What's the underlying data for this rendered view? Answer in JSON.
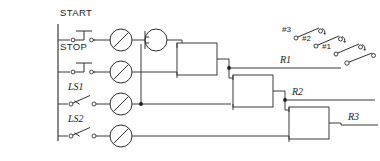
{
  "diagram": {
    "kind": "ladder-logic",
    "colors": {
      "wire": "#3b3b3b",
      "symbol": "#2e2e2e",
      "text": "#1a1a1a",
      "background": "#ffffff"
    },
    "rungs": [
      {
        "id": "rung-start",
        "label": "START",
        "input_type": "pushbutton-normally-open",
        "output_type": "coil"
      },
      {
        "id": "rung-stop",
        "label": "STOP",
        "input_type": "pushbutton-normally-open",
        "output_type": "coil"
      },
      {
        "id": "rung-ls1",
        "label": "LS1",
        "input_type": "limit-switch-normally-open",
        "output_type": "coil"
      },
      {
        "id": "rung-ls2",
        "label": "LS2",
        "input_type": "limit-switch-normally-open",
        "output_type": "coil"
      }
    ],
    "outputs": [
      {
        "id": "output-r1",
        "label": "R1"
      },
      {
        "id": "output-r2",
        "label": "R2"
      },
      {
        "id": "output-r3",
        "label": "R3"
      }
    ],
    "switch_bank": {
      "labels": [
        "#3",
        "#2",
        "#1"
      ],
      "count": 4,
      "type": "selector-switch"
    },
    "motor_symbol": {
      "id": "motor",
      "type": "circle-with-bar"
    }
  }
}
